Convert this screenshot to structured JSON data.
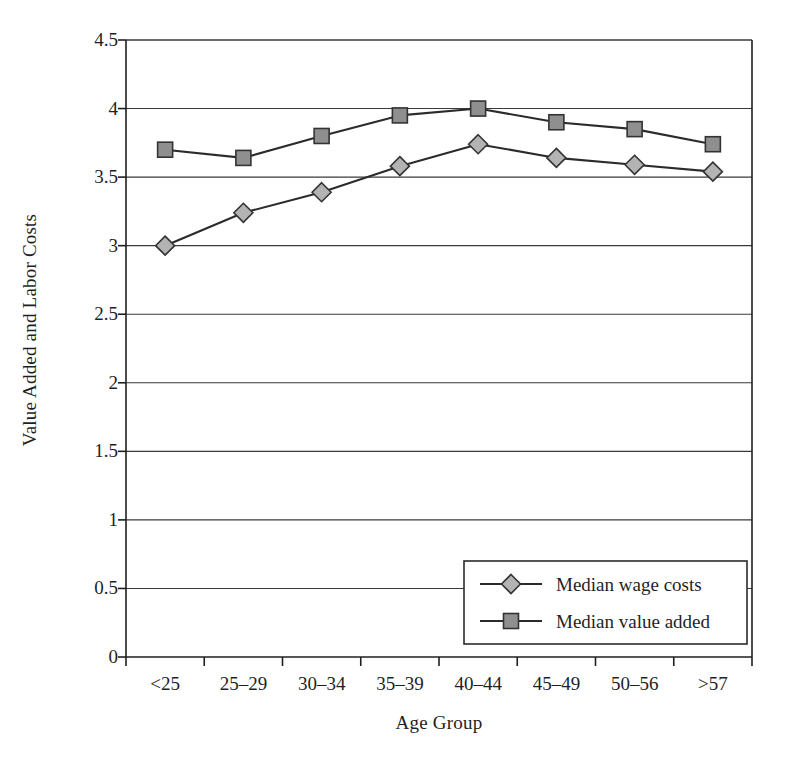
{
  "chart_data": {
    "type": "line",
    "title": "",
    "xlabel": "Age Group",
    "ylabel": "Value Added and Labor Costs",
    "categories": [
      "<25",
      "25–29",
      "30–34",
      "35–39",
      "40–44",
      "45–49",
      "50–56",
      ">57"
    ],
    "ylim": [
      0,
      4.5
    ],
    "ytick_labels": [
      "0",
      "0.5",
      "1",
      "1.5",
      "2",
      "2.5",
      "3",
      "3.5",
      "4",
      "4.5"
    ],
    "ytick_values": [
      0,
      0.5,
      1,
      1.5,
      2,
      2.5,
      3,
      3.5,
      4,
      4.5
    ],
    "grid": "horizontal",
    "legend_position": "bottom-right",
    "series": [
      {
        "name": "Median wage costs",
        "marker": "diamond",
        "marker_fill": "#b3b3b3",
        "line_color": "#2b2b2b",
        "values": [
          3.0,
          3.24,
          3.39,
          3.58,
          3.74,
          3.64,
          3.59,
          3.54
        ]
      },
      {
        "name": "Median value added",
        "marker": "square",
        "marker_fill": "#8f8f8f",
        "line_color": "#2b2b2b",
        "values": [
          3.7,
          3.64,
          3.8,
          3.95,
          4.0,
          3.9,
          3.85,
          3.74
        ]
      }
    ]
  },
  "colors": {
    "axis": "#1f1f1f",
    "grid": "#3a3a3a",
    "background": "#ffffff",
    "marker_diamond": "#b3b3b3",
    "marker_square": "#8f8f8f",
    "line": "#2b2b2b"
  }
}
